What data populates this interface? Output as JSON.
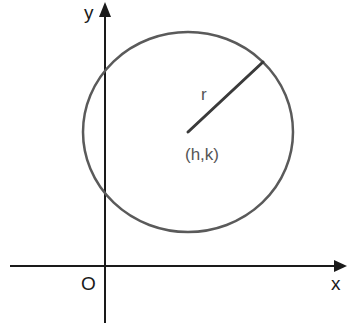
{
  "diagram": {
    "type": "circle-on-coordinate-plane",
    "labels": {
      "y_axis": "y",
      "x_axis": "x",
      "origin": "O",
      "radius": "r",
      "center": "(h,k)"
    },
    "colors": {
      "axes": "#1a1a1a",
      "circle": "#5a5a5a",
      "radius": "#3a3a3a",
      "center_label": "#555555",
      "background": "#ffffff"
    }
  }
}
